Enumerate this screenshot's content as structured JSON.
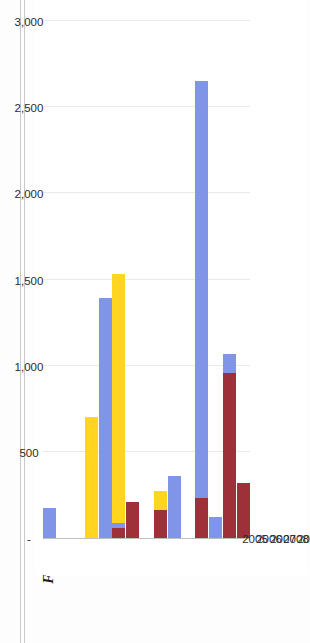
{
  "figure": {
    "title": "Figure 31: Chinese Investments (in US$ million) in Myanmar by Industrial Sector, 2005–19"
  },
  "chart_data": {
    "type": "bar",
    "orientation": "horizontal",
    "stacked": true,
    "title": "Figure 31: Chinese Investments (in US$ million) in Myanmar by Industrial Sector, 2005–19",
    "xlabel": "",
    "ylabel": "",
    "xlim": [
      0,
      3250
    ],
    "grid": true,
    "legend_position": "bottom",
    "categories": [
      "2005",
      "2006",
      "2007",
      "2008",
      "2009",
      "2010",
      "2011",
      "2012",
      "2013",
      "2014",
      "2015",
      "2016",
      "2017",
      "2018",
      "2019"
    ],
    "tick_labels": [
      "-",
      "500",
      "1,000",
      "1,500",
      "2,000",
      "2,500",
      "3,000"
    ],
    "tick_values": [
      0,
      500,
      1000,
      1500,
      2000,
      2500,
      3000
    ],
    "series": [
      {
        "name": "Infrastructure",
        "color": "#9E3039",
        "values": [
          0,
          0,
          0,
          0,
          0,
          60,
          210,
          0,
          160,
          0,
          0,
          230,
          0,
          960,
          320
        ]
      },
      {
        "name": "Energy",
        "color": "#8195E8",
        "values": [
          175,
          0,
          0,
          0,
          1390,
          30,
          0,
          0,
          0,
          360,
          0,
          2420,
          120,
          110,
          0
        ]
      },
      {
        "name": "Metals",
        "color": "#FFD520",
        "values": [
          0,
          0,
          0,
          700,
          0,
          1440,
          0,
          0,
          110,
          0,
          0,
          0,
          0,
          0,
          0
        ]
      },
      {
        "name": "Others",
        "color": "#8CC63E",
        "values": [
          0,
          0,
          0,
          0,
          0,
          0,
          0,
          0,
          0,
          0,
          0,
          0,
          0,
          0,
          0
        ]
      }
    ],
    "totals": [
      175,
      0,
      0,
      700,
      1390,
      1530,
      210,
      0,
      270,
      360,
      0,
      2650,
      120,
      1070,
      320
    ]
  },
  "colors": {
    "infrastructure": "#9E3039",
    "energy": "#8195E8",
    "metals": "#FFD520",
    "others": "#8CC63E",
    "grid": "#E9E9E9",
    "axis": "#BFBFBF",
    "text": "#2B2B2B"
  }
}
